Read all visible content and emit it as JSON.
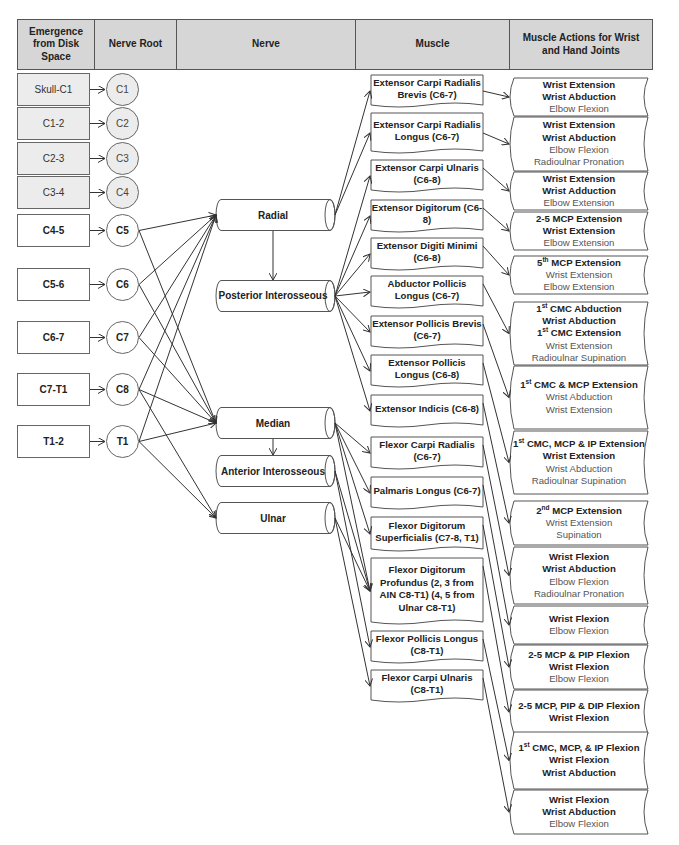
{
  "headers": {
    "emergence": "Emergence from Disk Space",
    "nerve_root": "Nerve Root",
    "nerve": "Nerve",
    "muscle": "Muscle",
    "actions": "Muscle Actions for Wrist and Hand Joints"
  },
  "segments": [
    {
      "label": "Skull-C1",
      "root": "C1",
      "style": "grey"
    },
    {
      "label": "C1-2",
      "root": "C2",
      "style": "grey"
    },
    {
      "label": "C2-3",
      "root": "C3",
      "style": "grey"
    },
    {
      "label": "C3-4",
      "root": "C4",
      "style": "grey"
    },
    {
      "label": "C4-5",
      "root": "C5",
      "style": "bold"
    },
    {
      "label": "C5-6",
      "root": "C6",
      "style": "bold"
    },
    {
      "label": "C6-7",
      "root": "C7",
      "style": "bold"
    },
    {
      "label": "C7-T1",
      "root": "C8",
      "style": "bold"
    },
    {
      "label": "T1-2",
      "root": "T1",
      "style": "bold"
    }
  ],
  "nerves": [
    {
      "id": "radial",
      "label": "Radial"
    },
    {
      "id": "pin",
      "label": "Posterior Interosseous"
    },
    {
      "id": "median",
      "label": "Median"
    },
    {
      "id": "ain",
      "label": "Anterior Interosseous"
    },
    {
      "id": "ulnar",
      "label": "Ulnar"
    }
  ],
  "root_to_nerve": {
    "C5": [
      "radial",
      "median"
    ],
    "C6": [
      "radial",
      "median"
    ],
    "C7": [
      "radial",
      "median"
    ],
    "C8": [
      "radial",
      "median",
      "ulnar"
    ],
    "T1": [
      "radial",
      "median",
      "ulnar"
    ]
  },
  "muscles": [
    {
      "label": "Extensor Carpi Radialis Brevis (C6-7)",
      "nerve": "radial"
    },
    {
      "label": "Extensor Carpi Radialis Longus (C6-7)",
      "nerve": "radial"
    },
    {
      "label": "Extensor Carpi Ulnaris (C6-8)",
      "nerve": "pin"
    },
    {
      "label": "Extensor Digitorum (C6-8)",
      "nerve": "pin"
    },
    {
      "label": "Extensor Digiti Minimi (C6-8)",
      "nerve": "pin"
    },
    {
      "label": "Abductor Pollicis Longus (C6-7)",
      "nerve": "pin"
    },
    {
      "label": "Extensor Pollicis Brevis (C6-7)",
      "nerve": "pin"
    },
    {
      "label": "Extensor Pollicis Longus (C6-8)",
      "nerve": "pin"
    },
    {
      "label": "Extensor Indicis (C6-8)",
      "nerve": "pin"
    },
    {
      "label": "Flexor Carpi Radialis (C6-7)",
      "nerve": "median"
    },
    {
      "label": "Palmaris Longus (C6-7)",
      "nerve": "median"
    },
    {
      "label": "Flexor Digitorum Superficialis (C7-8, T1)",
      "nerve": "median"
    },
    {
      "label": "Flexor Digitorum Profundus (2, 3 from AIN C8-T1) (4, 5 from Ulnar C8-T1)",
      "nerve": "ain, ulnar"
    },
    {
      "label": "Flexor Pollicis Longus (C8-T1)",
      "nerve": "ain"
    },
    {
      "label": "Flexor Carpi Ulnaris (C8-T1)",
      "nerve": "ulnar"
    }
  ],
  "actions": [
    [
      {
        "t": "Wrist Extension",
        "b": true
      },
      {
        "t": "Wrist Abduction",
        "b": true
      },
      {
        "t": "Elbow Flexion",
        "b": false
      }
    ],
    [
      {
        "t": "Wrist Extension",
        "b": true
      },
      {
        "t": "Wrist Abduction",
        "b": true
      },
      {
        "t": "Elbow Flexion",
        "b": false
      },
      {
        "t": "Radioulnar Pronation",
        "b": false
      }
    ],
    [
      {
        "t": "Wrist Extension",
        "b": true
      },
      {
        "t": "Wrist Adduction",
        "b": true
      },
      {
        "t": "Elbow Extension",
        "b": false
      }
    ],
    [
      {
        "t": "2-5 MCP Extension",
        "b": true
      },
      {
        "t": "Wrist Extension",
        "b": true
      },
      {
        "t": "Elbow Extension",
        "b": false
      }
    ],
    [
      {
        "t": "5th MCP Extension",
        "b": true,
        "sup": "th",
        "pre": "5",
        "post": " MCP Extension"
      },
      {
        "t": "Wrist Extension",
        "b": false
      },
      {
        "t": "Elbow Extension",
        "b": false
      }
    ],
    [
      {
        "t": "1st CMC Abduction",
        "b": true,
        "pre": "1",
        "sup": "st",
        "post": " CMC Abduction"
      },
      {
        "t": "Wrist Abduction",
        "b": true
      },
      {
        "t": "1st CMC Extension",
        "b": true,
        "pre": "1",
        "sup": "st",
        "post": " CMC Extension"
      },
      {
        "t": "Wrist Extension",
        "b": false
      },
      {
        "t": "Radioulnar Supination",
        "b": false
      }
    ],
    [
      {
        "t": "1st CMC & MCP Extension",
        "b": true,
        "pre": "1",
        "sup": "st",
        "post": " CMC & MCP Extension"
      },
      {
        "t": "Wrist Abduction",
        "b": false
      },
      {
        "t": "Wrist Extension",
        "b": false
      }
    ],
    [
      {
        "t": "1st CMC, MCP & IP Extension",
        "b": true,
        "pre": "1",
        "sup": "st",
        "post": " CMC, MCP & IP Extension"
      },
      {
        "t": "Wrist Extension",
        "b": true
      },
      {
        "t": "Wrist Abduction",
        "b": false
      },
      {
        "t": "Radioulnar Supination",
        "b": false
      }
    ],
    [
      {
        "t": "2nd MCP Extension",
        "b": true,
        "pre": "2",
        "sup": "nd",
        "post": " MCP Extension"
      },
      {
        "t": "Wrist Extension",
        "b": false
      },
      {
        "t": "Supination",
        "b": false
      }
    ],
    [
      {
        "t": "Wrist Flexion",
        "b": true
      },
      {
        "t": "Wrist Abduction",
        "b": true
      },
      {
        "t": "Elbow Flexion",
        "b": false
      },
      {
        "t": "Radioulnar Pronation",
        "b": false
      }
    ],
    [
      {
        "t": "Wrist Flexion",
        "b": true
      },
      {
        "t": "Elbow Flexion",
        "b": false
      }
    ],
    [
      {
        "t": "2-5 MCP & PIP Flexion",
        "b": true
      },
      {
        "t": "Wrist Flexion",
        "b": true
      },
      {
        "t": "Elbow Flexion",
        "b": false
      }
    ],
    [
      {
        "t": "2-5 MCP, PIP & DIP Flexion",
        "b": true
      },
      {
        "t": "Wrist Flexion",
        "b": true
      }
    ],
    [
      {
        "t": "1st CMC, MCP, & IP Flexion",
        "b": true,
        "pre": "1",
        "sup": "st",
        "post": " CMC, MCP, & IP Flexion"
      },
      {
        "t": "Wrist Flexion",
        "b": true
      },
      {
        "t": "Wrist Abduction",
        "b": true
      }
    ],
    [
      {
        "t": "Wrist Flexion",
        "b": true
      },
      {
        "t": "Wrist Abduction",
        "b": true
      },
      {
        "t": "Elbow Flexion",
        "b": false
      }
    ]
  ],
  "colors": {
    "header_bg": "#d6d6d6",
    "grey_box_bg": "#ececec",
    "line": "#333333"
  }
}
